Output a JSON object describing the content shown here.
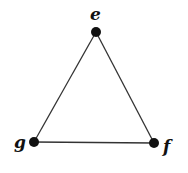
{
  "diagram": {
    "type": "graph",
    "nodes": [
      {
        "id": "e",
        "label": "e",
        "x": 96,
        "y": 32
      },
      {
        "id": "f",
        "label": "f",
        "x": 154,
        "y": 143
      },
      {
        "id": "g",
        "label": "g",
        "x": 34,
        "y": 142
      }
    ],
    "edges": [
      {
        "from": "e",
        "to": "f"
      },
      {
        "from": "f",
        "to": "g"
      },
      {
        "from": "g",
        "to": "e"
      }
    ],
    "colors": {
      "node": "#111111",
      "edge": "#333333"
    }
  }
}
